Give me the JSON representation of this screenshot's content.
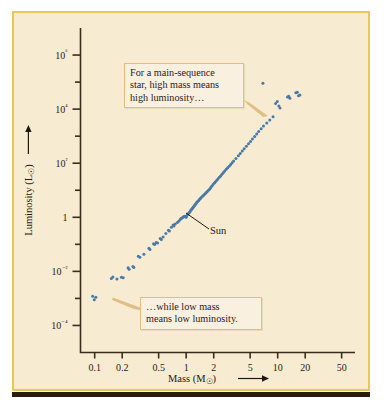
{
  "figure": {
    "background_color": "#f7ecd2",
    "border_color": "#e9c75a",
    "point_color": "#4a79a8",
    "axis_color": "#3b2d1b"
  },
  "annotations": {
    "high_mass_line1": "For a main-sequence",
    "high_mass_line2": "star, high mass means",
    "high_mass_line3": "high luminosity…",
    "low_mass_line1": "…while low mass",
    "low_mass_line2": "means low luminosity.",
    "sun_label": "Sun"
  },
  "chart_data": {
    "type": "scatter",
    "title": "",
    "xlabel": "Mass (M☉)",
    "ylabel": "Luminosity (L☉)",
    "xscale": "log",
    "yscale": "log",
    "xlim": [
      0.07,
      70
    ],
    "ylim": [
      1e-05,
      10000000.0
    ],
    "grid": false,
    "legend": null,
    "xtick_labels": [
      "0.1",
      "0.2",
      "0.5",
      "1",
      "2",
      "5",
      "10",
      "20",
      "50"
    ],
    "xtick_values": [
      0.1,
      0.2,
      0.5,
      1,
      2,
      5,
      10,
      20,
      50
    ],
    "ytick_labels": [
      "10⁶",
      "10⁴",
      "10²",
      "1",
      "10⁻²",
      "10⁻⁴"
    ],
    "ytick_values": [
      1000000,
      10000,
      100,
      1,
      0.01,
      0.0001
    ],
    "ytick_minor_values": [
      100000,
      1000,
      10,
      0.1,
      0.001
    ],
    "series": [
      {
        "name": "main-sequence stars",
        "color": "#4a79a8",
        "points": [
          [
            0.095,
            0.0012
          ],
          [
            0.103,
            0.0011
          ],
          [
            0.099,
            0.0009
          ],
          [
            0.152,
            0.0055
          ],
          [
            0.158,
            0.0062
          ],
          [
            0.175,
            0.0052
          ],
          [
            0.196,
            0.006
          ],
          [
            0.205,
            0.0058
          ],
          [
            0.232,
            0.0135
          ],
          [
            0.238,
            0.012
          ],
          [
            0.262,
            0.0152
          ],
          [
            0.268,
            0.014
          ],
          [
            0.3,
            0.036
          ],
          [
            0.312,
            0.033
          ],
          [
            0.345,
            0.043
          ],
          [
            0.392,
            0.071
          ],
          [
            0.402,
            0.065
          ],
          [
            0.44,
            0.105
          ],
          [
            0.452,
            0.098
          ],
          [
            0.47,
            0.118
          ],
          [
            0.487,
            0.112
          ],
          [
            0.52,
            0.165
          ],
          [
            0.535,
            0.15
          ],
          [
            0.56,
            0.185
          ],
          [
            0.6,
            0.25
          ],
          [
            0.64,
            0.33
          ],
          [
            0.655,
            0.31
          ],
          [
            0.69,
            0.43
          ],
          [
            0.72,
            0.52
          ],
          [
            0.735,
            0.48
          ],
          [
            0.76,
            0.56
          ],
          [
            0.8,
            0.64
          ],
          [
            0.83,
            0.72
          ],
          [
            0.86,
            0.83
          ],
          [
            0.88,
            0.9
          ],
          [
            0.9,
            0.95
          ],
          [
            0.92,
            1.0
          ],
          [
            0.94,
            1.05
          ],
          [
            0.96,
            1.1
          ],
          [
            0.98,
            1.05
          ],
          [
            1.0,
            1.0
          ],
          [
            1.01,
            1.12
          ],
          [
            1.03,
            1.25
          ],
          [
            1.05,
            1.35
          ],
          [
            1.07,
            1.45
          ],
          [
            1.09,
            1.55
          ],
          [
            1.11,
            1.7
          ],
          [
            1.13,
            1.85
          ],
          [
            1.15,
            2.0
          ],
          [
            1.17,
            2.15
          ],
          [
            1.19,
            2.3
          ],
          [
            1.21,
            2.5
          ],
          [
            1.23,
            2.7
          ],
          [
            1.25,
            2.9
          ],
          [
            1.27,
            3.1
          ],
          [
            1.29,
            3.35
          ],
          [
            1.31,
            3.6
          ],
          [
            1.34,
            3.9
          ],
          [
            1.37,
            4.2
          ],
          [
            1.4,
            4.6
          ],
          [
            1.43,
            5.0
          ],
          [
            1.46,
            5.4
          ],
          [
            1.5,
            5.9
          ],
          [
            1.54,
            6.4
          ],
          [
            1.58,
            7.0
          ],
          [
            1.62,
            7.6
          ],
          [
            1.66,
            8.3
          ],
          [
            1.7,
            9.0
          ],
          [
            1.75,
            10.0
          ],
          [
            1.8,
            11.0
          ],
          [
            1.85,
            12.5
          ],
          [
            1.9,
            14.0
          ],
          [
            1.96,
            16.0
          ],
          [
            2.02,
            18.0
          ],
          [
            2.08,
            20.0
          ],
          [
            2.15,
            23.0
          ],
          [
            2.22,
            26.0
          ],
          [
            2.3,
            30.0
          ],
          [
            2.38,
            34.0
          ],
          [
            2.46,
            39.0
          ],
          [
            2.55,
            45.0
          ],
          [
            2.64,
            52.0
          ],
          [
            2.74,
            60.0
          ],
          [
            2.84,
            68.0
          ],
          [
            2.95,
            78.0
          ],
          [
            3.06,
            90.0
          ],
          [
            3.18,
            105.0
          ],
          [
            3.3,
            120.0
          ],
          [
            3.5,
            150.0
          ],
          [
            3.72,
            190.0
          ],
          [
            3.9,
            230.0
          ],
          [
            4.1,
            280.0
          ],
          [
            4.3,
            340.0
          ],
          [
            4.55,
            420.0
          ],
          [
            4.8,
            520.0
          ],
          [
            5.05,
            640.0
          ],
          [
            5.3,
            790.0
          ],
          [
            5.6,
            980.0
          ],
          [
            5.9,
            1200.0
          ],
          [
            6.2,
            1500.0
          ],
          [
            6.6,
            1900.0
          ],
          [
            7.0,
            2400.0
          ],
          [
            7.6,
            3100.0
          ],
          [
            8.2,
            4000.0
          ],
          [
            8.9,
            5200.0
          ],
          [
            6.9,
            90000.0
          ],
          [
            9.5,
            16000.0
          ],
          [
            9.9,
            19000.0
          ],
          [
            10.3,
            13000.0
          ],
          [
            10.6,
            11000.0
          ],
          [
            12.8,
            28000.0
          ],
          [
            13.2,
            30000.0
          ],
          [
            13.6,
            25000.0
          ],
          [
            15.8,
            40000.0
          ],
          [
            16.4,
            42000.0
          ],
          [
            16.9,
            31000.0
          ],
          [
            17.5,
            33000.0
          ]
        ]
      }
    ]
  }
}
